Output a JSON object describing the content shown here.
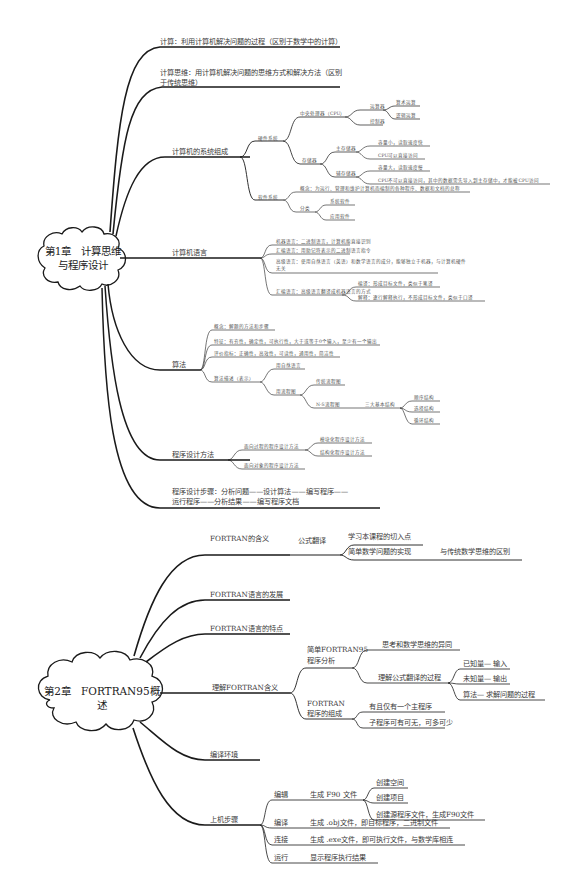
{
  "chapter1": {
    "title_line1": "第1章　计算思维",
    "title_line2": "与程序设计",
    "branches": {
      "computing": "计算：利用计算机解决问题的过程（区别于数学中的计算）",
      "thinking_line1": "计算思维：用计算机解决问题的思维方式和解决方法（区别",
      "thinking_line2": "于传统思维）",
      "system": {
        "label": "计算机的系统组成",
        "hardware": {
          "label": "硬件系统",
          "cpu": {
            "label": "中央处理器（CPU）",
            "alu": {
              "label": "运算器",
              "children": [
                "算术运算",
                "逻辑运算"
              ]
            },
            "control": "控制器"
          },
          "memory": {
            "label": "存储器",
            "main": {
              "label": "主存储器",
              "children": [
                "容量小，读取速度快",
                "CPU可以直接访问"
              ]
            },
            "aux": {
              "label": "辅存储器",
              "children": [
                "容量大，读取速度慢",
                "CPU不可以直接访问，其中的数据需先导入到主存储中，才能被CPU访问"
              ]
            }
          }
        },
        "software": {
          "label": "软件系统",
          "concept": "概念：为运行、管理和维护计算机而编制的各种程序、数据和文档的总称",
          "category": {
            "label": "分类",
            "children": [
              "系统软件",
              "应用软件"
            ]
          }
        }
      },
      "language": {
        "label": "计算机语言",
        "items": [
          "机器语言：二进制语言，计算机能直接识别",
          "汇编语言：用助记符表示的二进制语言指令",
          "高级语言：使用自然语言（英语）和数学语言的成分，能够独立于机器，与计算机硬件",
          "无关"
        ],
        "translate": {
          "label": "汇编语言：高级语言翻译成机器语言的方式",
          "children": [
            "编译：形成目标文件，类似于笔译",
            "解释：逐行解释执行，不形成目标文件，类似于口译"
          ]
        }
      },
      "algorithm": {
        "label": "算法",
        "items": [
          "概念：解题的方法和步骤",
          "特征：有穷性，确定性，可执行性，大于或等于0个输入，至少有一个输出",
          "评价指标：正确性，高效性，可读性，通用性，简洁性"
        ],
        "describe": {
          "label": "算法描述（表示）",
          "natural": "用自然语言",
          "flowchart": {
            "label": "用流程图",
            "traditional": "传统流程图",
            "ns": {
              "label": "N-S流程图",
              "structures": {
                "label": "三大基本结构",
                "children": [
                  "顺序结构",
                  "选择结构",
                  "循环结构"
                ]
              }
            }
          }
        }
      },
      "method": {
        "label": "程序设计方法",
        "procedural": {
          "label": "面向过程的程序设计方法",
          "children": [
            "模块化程序设计方法",
            "结构化程序设计方法"
          ]
        },
        "oop": "面向对象的程序设计方法"
      },
      "steps_line1": "程序设计步骤：分析问题——设计算法——编写程序——",
      "steps_line2": "运行程序——分析结果——编写程序文档"
    }
  },
  "chapter2": {
    "title": "第2章　FORTRAN95概述",
    "branches": {
      "meaning": {
        "label": "FORTRAN的含义",
        "formula": {
          "label": "公式翻译",
          "children": [
            "学习本课程的切入点",
            "简单数学问题的实现"
          ],
          "difference": "与传统数学思维的区别"
        }
      },
      "development": "FORTRAN语言的发展",
      "features": "FORTRAN语言的特点",
      "understand": {
        "label": "理解FORTRAN含义",
        "simple": {
          "label_line1": "简单FORTRAN95",
          "label_line2": "程序分析",
          "diff": "思考和数学思维的异同",
          "process": {
            "label": "理解公式翻译的过程",
            "children": [
              "已知量— 输入",
              "未知量— 输出",
              "算法— 求解问题的过程"
            ]
          }
        },
        "composition": {
          "label_line1": "FORTRAN",
          "label_line2": "程序的组成",
          "children": [
            "有且仅有一个主程序",
            "子程序可有可无，可多可少"
          ]
        }
      },
      "env": "编译环境",
      "steps": {
        "label": "上机步骤",
        "edit": {
          "label": "编辑",
          "action": "生成 F90 文件",
          "children": [
            "创建空间",
            "创建项目",
            "创建源程序文件，生成F90文件"
          ]
        },
        "compile": {
          "label": "编译",
          "action": "生成 .obj文件，即目标程序，二进制文件"
        },
        "link": {
          "label": "连接",
          "action": "生成 .exe文件，即可执行文件，与数学库相连"
        },
        "run": {
          "label": "运行",
          "action": "显示程序执行结果"
        }
      }
    }
  }
}
